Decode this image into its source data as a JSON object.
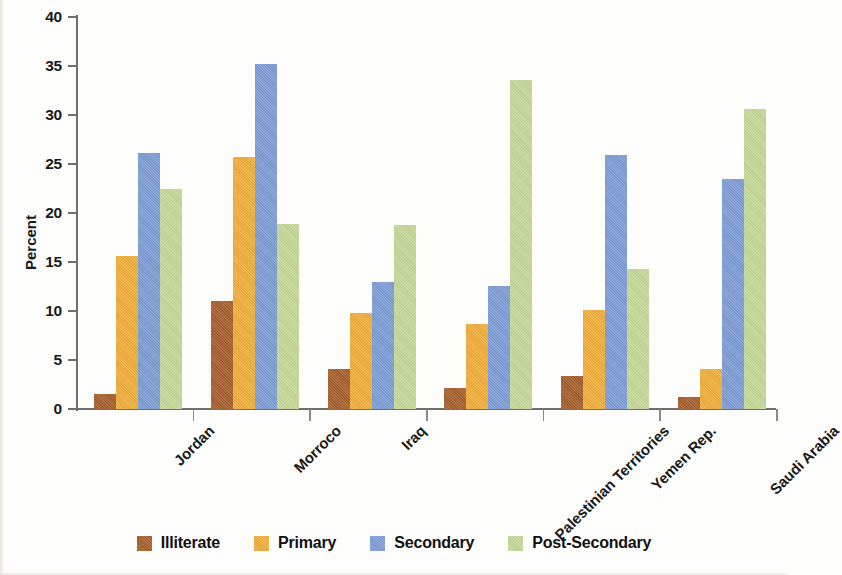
{
  "chart_data": {
    "type": "bar",
    "title": "",
    "xlabel": "",
    "ylabel": "Percent",
    "ylim": [
      0,
      40
    ],
    "yticks": [
      0,
      5,
      10,
      15,
      20,
      25,
      30,
      35,
      40
    ],
    "grid": false,
    "legend_position": "bottom",
    "categories": [
      "Jordan",
      "Morroco",
      "Iraq",
      "Palestinian Territories",
      "Yemen Rep.",
      "Saudi Arabia"
    ],
    "series": [
      {
        "name": "Illiterate",
        "color": "#a5602f",
        "values": [
          1.5,
          11.0,
          4.1,
          2.1,
          3.4,
          1.2
        ]
      },
      {
        "name": "Primary",
        "color": "#f0ad3c",
        "values": [
          15.6,
          25.7,
          9.8,
          8.7,
          10.1,
          4.1
        ]
      },
      {
        "name": "Secondary",
        "color": "#7d9dd4",
        "values": [
          26.1,
          35.2,
          13.0,
          12.6,
          25.9,
          23.5
        ]
      },
      {
        "name": "Post-Secondary",
        "color": "#c4d798",
        "values": [
          22.5,
          18.9,
          18.8,
          33.6,
          14.3,
          30.6
        ]
      }
    ]
  },
  "axis": {
    "y_label": "Percent",
    "y_tick_labels": [
      "0",
      "5",
      "10",
      "15",
      "20",
      "25",
      "30",
      "35",
      "40"
    ]
  },
  "legend": {
    "items": [
      {
        "label": "Illiterate",
        "color": "#a5602f"
      },
      {
        "label": "Primary",
        "color": "#f0ad3c"
      },
      {
        "label": "Secondary",
        "color": "#7d9dd4"
      },
      {
        "label": "Post-Secondary",
        "color": "#c4d798"
      }
    ]
  },
  "colors": {
    "illiterate": "#a5602f",
    "primary": "#f0ad3c",
    "secondary": "#7d9dd4",
    "post_secondary": "#c4d798",
    "axis": "#6e6e6e",
    "text": "#1a1a1a",
    "background": "#fdfdfb"
  }
}
